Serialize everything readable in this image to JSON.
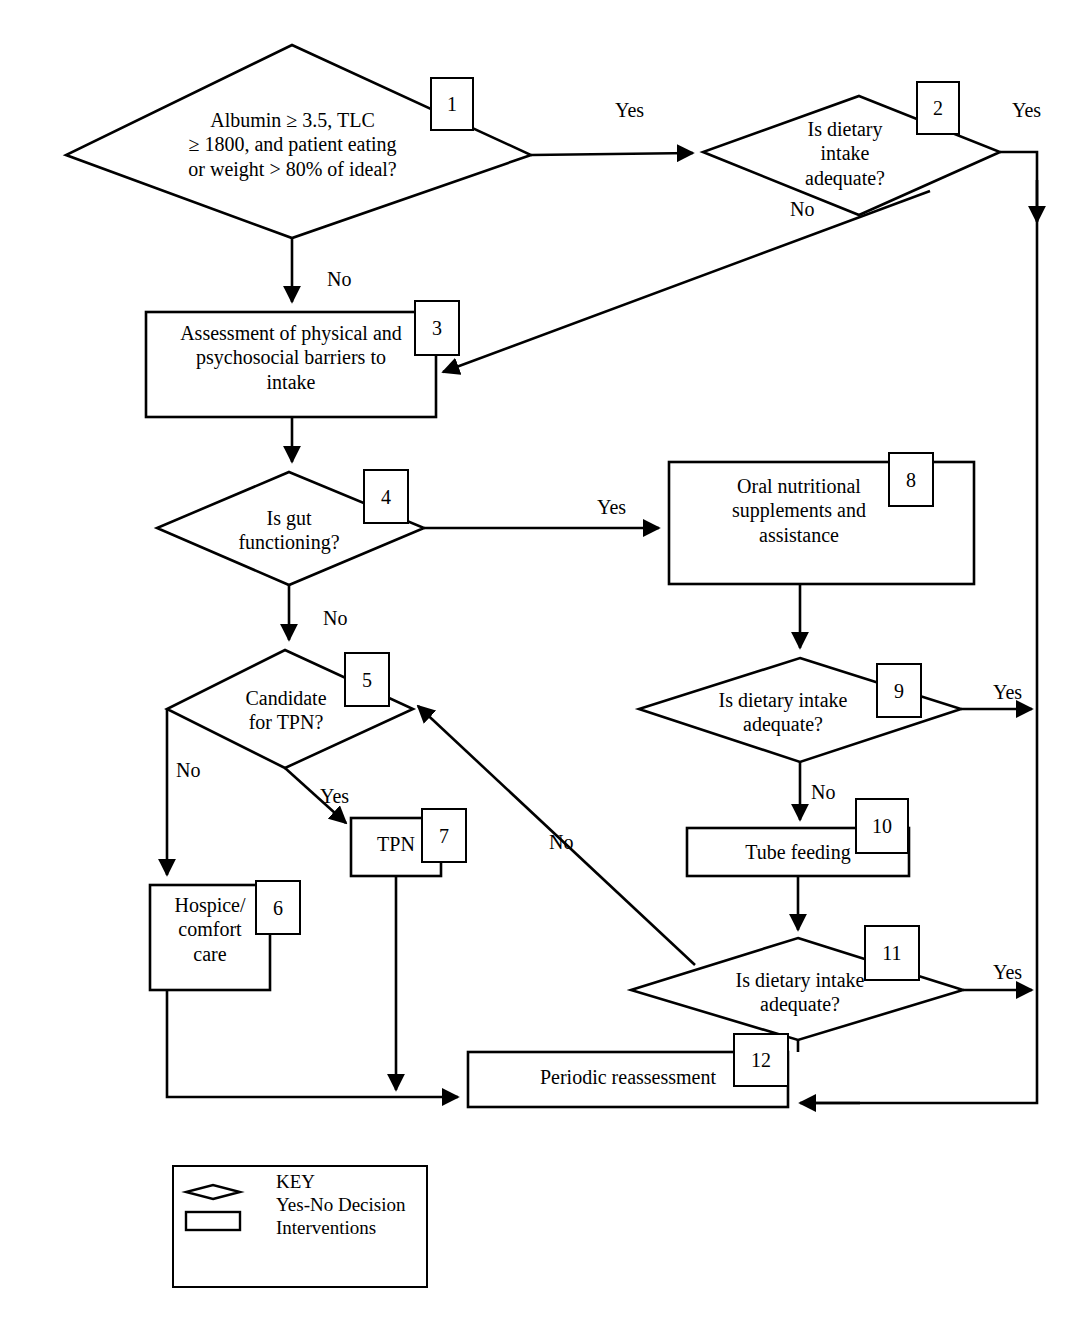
{
  "diagram": {
    "line_color": "#000000",
    "background_color": "#ffffff",
    "nodes": [
      {
        "id": "1",
        "shape": "diamond",
        "label": "Albumin ≥ 3.5, TLC\n≥ 1800, and patient eating\nor  weight > 80% of ideal?"
      },
      {
        "id": "2",
        "shape": "diamond",
        "label": "Is dietary\nintake\nadequate?"
      },
      {
        "id": "3",
        "shape": "rectangle",
        "label": "Assessment of physical and\npsychosocial barriers to\nintake"
      },
      {
        "id": "4",
        "shape": "diamond",
        "label": "Is gut\nfunctioning?"
      },
      {
        "id": "5",
        "shape": "diamond",
        "label": "Candidate\nfor TPN?"
      },
      {
        "id": "6",
        "shape": "rectangle",
        "label": "Hospice/\ncomfort\ncare"
      },
      {
        "id": "7",
        "shape": "rectangle",
        "label": "TPN"
      },
      {
        "id": "8",
        "shape": "rectangle",
        "label": "Oral nutritional\nsupplements and\nassistance"
      },
      {
        "id": "9",
        "shape": "diamond",
        "label": "Is dietary intake\nadequate?"
      },
      {
        "id": "10",
        "shape": "rectangle",
        "label": "Tube feeding"
      },
      {
        "id": "11",
        "shape": "diamond",
        "label": "Is dietary intake\nadequate?"
      },
      {
        "id": "12",
        "shape": "rectangle",
        "label": "Periodic reassessment"
      }
    ],
    "edge_labels": [
      {
        "id": "e1-2",
        "text": "Yes",
        "from": "1",
        "to": "2"
      },
      {
        "id": "e2-yes",
        "text": "Yes",
        "from": "2",
        "to": "12"
      },
      {
        "id": "e2-no",
        "text": "No",
        "from": "2",
        "to": "3"
      },
      {
        "id": "e1-no",
        "text": "No",
        "from": "1",
        "to": "3"
      },
      {
        "id": "e4-yes",
        "text": "Yes",
        "from": "4",
        "to": "8"
      },
      {
        "id": "e4-no",
        "text": "No",
        "from": "4",
        "to": "5"
      },
      {
        "id": "e5-no",
        "text": "No",
        "from": "5",
        "to": "6"
      },
      {
        "id": "e5-yes",
        "text": "Yes",
        "from": "5",
        "to": "7"
      },
      {
        "id": "e9-yes",
        "text": "Yes",
        "from": "9",
        "to": "12"
      },
      {
        "id": "e9-no",
        "text": "No",
        "from": "9",
        "to": "10"
      },
      {
        "id": "e11-no",
        "text": "No",
        "from": "11",
        "to": "5"
      },
      {
        "id": "e11-yes",
        "text": "Yes",
        "from": "11",
        "to": "12"
      }
    ],
    "key": {
      "title": "KEY",
      "decision_label": "Yes-No Decision",
      "intervention_label": "Interventions",
      "decision_shape": "diamond",
      "intervention_shape": "rectangle"
    }
  }
}
